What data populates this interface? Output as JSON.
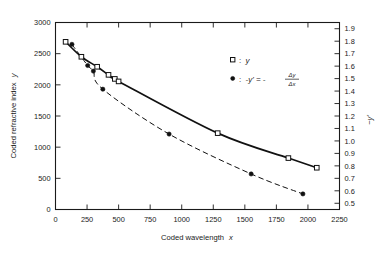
{
  "chart_data": {
    "type": "scatter",
    "title": "",
    "xlabel": "Coded wavelength x",
    "ylabel": "Coded refractive index y",
    "y2label": "-y'",
    "xlim": [
      0,
      2250
    ],
    "ylim": [
      0,
      3000
    ],
    "y2lim": [
      0.45,
      1.95
    ],
    "grid": false,
    "legend_position": "upper-right-inside",
    "xticks": [
      0,
      250,
      500,
      750,
      1000,
      1250,
      1500,
      1750,
      2000,
      2250
    ],
    "xticklabels": [
      "0",
      "250",
      "500",
      "750",
      "1000",
      "1250",
      "1500",
      "1750",
      "2000",
      "2250"
    ],
    "yticks": [
      0,
      500,
      1000,
      1500,
      2000,
      2500,
      3000
    ],
    "yticklabels": [
      "0",
      "500",
      "1000",
      "1500",
      "2000",
      "2500",
      "3000"
    ],
    "y2ticks": [
      0.5,
      0.6,
      0.7,
      0.8,
      0.9,
      1.0,
      1.1,
      1.2,
      1.3,
      1.4,
      1.5,
      1.6,
      1.7,
      1.8,
      1.9
    ],
    "y2ticklabels": [
      "0.5",
      "0.6",
      "0.7",
      "0.8",
      "0.9",
      "1.0",
      "1.1",
      "1.2",
      "1.3",
      "1.4",
      "1.5",
      "1.6",
      "1.7",
      "1.8",
      "1.9"
    ],
    "series": [
      {
        "name": "y",
        "axis": "left",
        "marker": "open-square",
        "line": "solid",
        "points": [
          {
            "x": 80,
            "y": 2690
          },
          {
            "x": 205,
            "y": 2450
          },
          {
            "x": 330,
            "y": 2290
          },
          {
            "x": 420,
            "y": 2160
          },
          {
            "x": 470,
            "y": 2095
          },
          {
            "x": 500,
            "y": 2055
          },
          {
            "x": 1285,
            "y": 1225
          },
          {
            "x": 1845,
            "y": 825
          },
          {
            "x": 2070,
            "y": 670
          }
        ]
      },
      {
        "name": "-y' = -dy/dx",
        "axis": "right",
        "marker": "filled-circle",
        "line": "dashed",
        "points": [
          {
            "x": 130,
            "y": 1.775
          },
          {
            "x": 255,
            "y": 1.605
          },
          {
            "x": 300,
            "y": 1.56
          },
          {
            "x": 375,
            "y": 1.415
          },
          {
            "x": 900,
            "y": 1.055
          },
          {
            "x": 1550,
            "y": 0.735
          },
          {
            "x": 1960,
            "y": 0.575
          }
        ]
      }
    ],
    "legend": [
      {
        "marker": "open-square",
        "separator": ":",
        "label": "y"
      },
      {
        "marker": "filled-circle",
        "separator": ":",
        "label": "-y' = -",
        "fraction_numerator": "Δy",
        "fraction_denominator": "Δx"
      }
    ]
  },
  "axes": {
    "left_title": "Coded refractive index",
    "left_title_var": "y",
    "bottom_title": "Coded wavelength",
    "bottom_title_var": "x",
    "right_title_prefix": "−",
    "right_title_var": "y′"
  }
}
